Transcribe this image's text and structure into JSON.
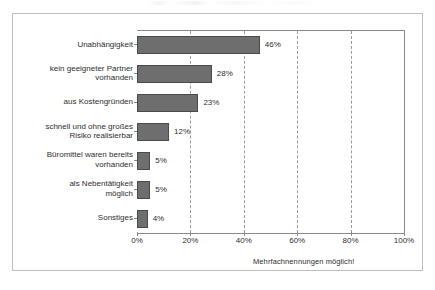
{
  "chart_data": {
    "type": "bar",
    "orientation": "horizontal",
    "title": "",
    "xlabel": "",
    "ylabel": "",
    "xlim": [
      0,
      100
    ],
    "grid": true,
    "legend": false,
    "categories": [
      "Unabhängigkeit",
      "kein geeigneter Partner vorhanden",
      "aus Kostengründen",
      "schnell und ohne großes Risiko realisierbar",
      "Büromittel waren bereits vorhanden",
      "als Nebentätigkeit möglich",
      "Sonstiges"
    ],
    "category_lines": [
      [
        "Unabhängigkeit"
      ],
      [
        "kein geeigneter Partner",
        "vorhanden"
      ],
      [
        "aus Kostengründen"
      ],
      [
        "schnell und ohne großes",
        "Risiko realisierbar"
      ],
      [
        "Büromittel waren bereits",
        "vorhanden"
      ],
      [
        "als Nebentätigkeit",
        "möglich"
      ],
      [
        "Sonstiges"
      ]
    ],
    "values": [
      46,
      28,
      23,
      12,
      5,
      5,
      4
    ],
    "data_labels": [
      "46%",
      "28%",
      "23%",
      "12%",
      "5%",
      "5%",
      "4%"
    ],
    "xticks": [
      0,
      20,
      40,
      60,
      80,
      100
    ],
    "xtick_labels": [
      "0%",
      "20%",
      "40%",
      "60%",
      "80%",
      "100%"
    ],
    "bar_color": "#6e6e6e",
    "bar_edge_color": "#4a4a4a",
    "gridline_color": "#9a9a9a",
    "axis_color": "#8a8a8a"
  },
  "annotations": {
    "footnote": "Mehrfachnennungen möglich!"
  }
}
